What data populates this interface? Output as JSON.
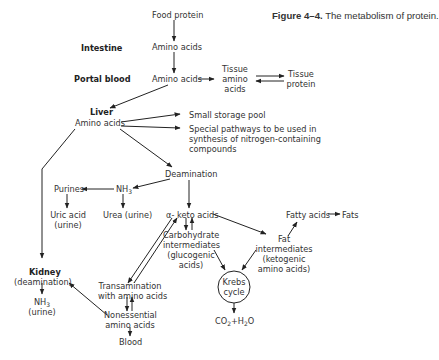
{
  "caption": {
    "figure_number": "Figure 4–4.",
    "title": "The metabolism of protein."
  },
  "labels": {
    "intestine": "Intestine",
    "portal_blood": "Portal blood",
    "liver": "Liver",
    "kidney": "Kidney"
  },
  "nodes": {
    "food_protein": "Food protein",
    "amino_acids_intestine": "Amino acids",
    "amino_acids_portal": "Amino acids",
    "tissue_amino_acids_1": "Tissue",
    "tissue_amino_acids_2": "amino",
    "tissue_amino_acids_3": "acids",
    "tissue_protein_1": "Tissue",
    "tissue_protein_2": "protein",
    "amino_acids_liver": "Amino acids",
    "small_storage_pool": "Small storage pool",
    "special_pathways_1": "Special pathways to be used in",
    "special_pathways_2": "synthesis of nitrogen-containing",
    "special_pathways_3": "compounds",
    "deamination": "Deamination",
    "purines": "Purines",
    "nh3": "NH",
    "nh3_sub": "3",
    "uric_acid_1": "Uric acid",
    "uric_acid_2": "(urine)",
    "urea": "Urea (urine)",
    "alpha_keto_acids": "α- keto acids",
    "fatty_acids": "Fatty acids",
    "fats": "Fats",
    "carbohydrate_1": "Carbohydrate",
    "carbohydrate_2": "intermediates",
    "carbohydrate_3": "(glucogenic",
    "carbohydrate_4": "acids)",
    "fat_int_1": "Fat",
    "fat_int_2": "intermediates",
    "fat_int_3": "(ketogenic",
    "fat_int_4": "amino acids)",
    "krebs_1": "Krebs",
    "krebs_2": "cycle",
    "co2": "CO",
    "co2_sub": "2",
    "h2o_plus": "+H",
    "h2o_sub": "2",
    "h2o_o": "O",
    "kidney_deamination": "(deamination)",
    "kidney_nh3": "NH",
    "kidney_nh3_sub": "3",
    "kidney_urine": "(urine)",
    "transamination_1": "Transamination",
    "transamination_2": "with amino acids",
    "nonessential_1": "Nonessential",
    "nonessential_2": "amino acids",
    "blood": "Blood"
  }
}
